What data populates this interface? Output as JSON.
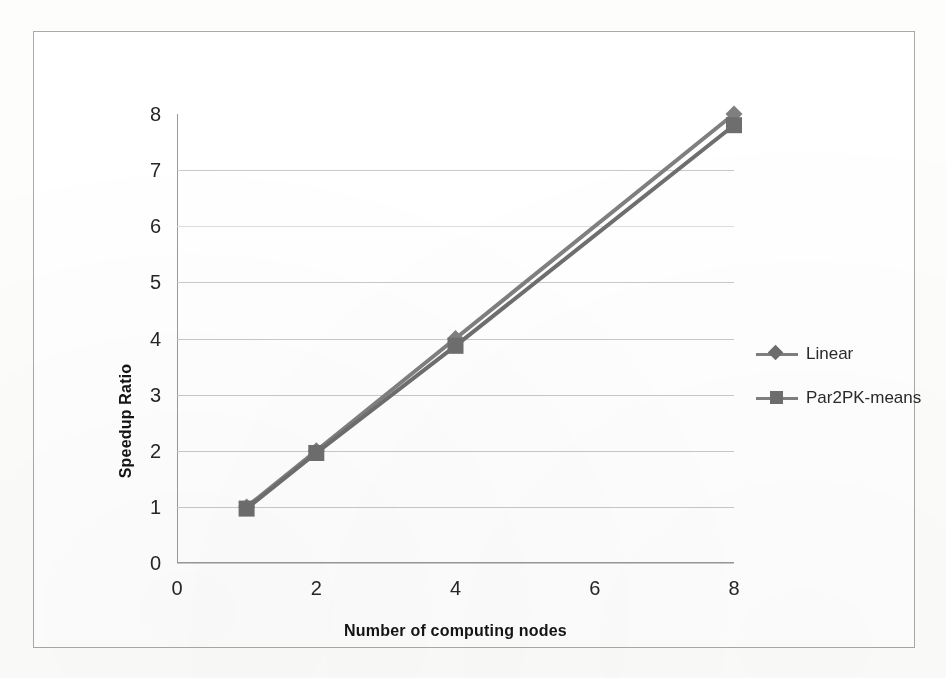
{
  "chart_data": {
    "type": "line",
    "title": "",
    "xlabel": "Number of computing nodes",
    "ylabel": "Speedup Ratio",
    "x": [
      1,
      2,
      4,
      8
    ],
    "xlim": [
      0,
      8
    ],
    "ylim": [
      0,
      8
    ],
    "x_ticks": [
      0,
      2,
      4,
      6,
      8
    ],
    "y_ticks": [
      0,
      1,
      2,
      3,
      4,
      5,
      6,
      7,
      8
    ],
    "x_tick_labels": [
      "0",
      "2",
      "4",
      "6",
      "8"
    ],
    "y_tick_labels": [
      "0",
      "1",
      "2",
      "3",
      "4",
      "5",
      "6",
      "7",
      "8"
    ],
    "grid": "horizontal",
    "legend_position": "right",
    "series": [
      {
        "name": "Linear",
        "marker": "diamond",
        "color": "#7f7f7f",
        "x": [
          1,
          2,
          4,
          8
        ],
        "values": [
          1,
          2,
          4,
          8
        ]
      },
      {
        "name": "Par2PK-means",
        "marker": "square",
        "color": "#6e6e6e",
        "x": [
          1,
          2,
          4,
          8
        ],
        "values": [
          0.97,
          1.96,
          3.87,
          7.8
        ]
      }
    ]
  },
  "legend": {
    "entries": [
      {
        "label": "Linear",
        "marker": "diamond-marker"
      },
      {
        "label": "Par2PK-means",
        "marker": "square-marker"
      }
    ]
  },
  "axes": {
    "y_title": "Speedup Ratio",
    "x_title": "Number of computing nodes",
    "y_labels": [
      "8",
      "7",
      "6",
      "5",
      "4",
      "3",
      "2",
      "1",
      "0"
    ],
    "x_labels": [
      "0",
      "2",
      "4",
      "6",
      "8"
    ]
  },
  "colors": {
    "series_line": "#7f7f7f",
    "gridline": "#c9c9c9",
    "axis": "#9a9a9a",
    "frame": "#a9a9a9",
    "text": "#262626"
  }
}
